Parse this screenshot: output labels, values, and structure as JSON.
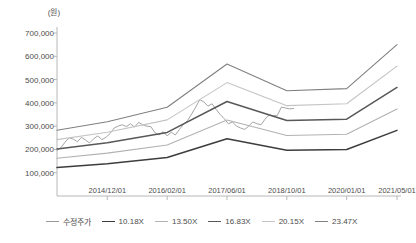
{
  "chart_data": {
    "type": "line",
    "title": "",
    "unit_label": "(원)",
    "xlabel": "",
    "ylabel": "",
    "ylim": [
      0,
      700000
    ],
    "y_ticks": [
      100000,
      200000,
      300000,
      400000,
      500000,
      600000,
      700000
    ],
    "y_tick_labels": [
      "100,000",
      "200,000",
      "300,000",
      "400,000",
      "500,000",
      "600,000",
      "700,000"
    ],
    "grid": false,
    "legend_position": "bottom",
    "x_tick_labels": [
      "2014/12/01",
      "2016/02/01",
      "2017/06/01",
      "2018/10/01",
      "2020/01/01",
      "2021/05/01"
    ],
    "x_tick_positions": [
      0.148,
      0.324,
      0.5,
      0.676,
      0.852,
      1.0
    ],
    "series": [
      {
        "name": "수정주가",
        "color": "#9a9a9a",
        "width": 0.9,
        "x": [
          0.0,
          0.012,
          0.024,
          0.036,
          0.048,
          0.06,
          0.072,
          0.084,
          0.096,
          0.108,
          0.12,
          0.132,
          0.144,
          0.156,
          0.168,
          0.18,
          0.192,
          0.204,
          0.216,
          0.228,
          0.24,
          0.252,
          0.264,
          0.276,
          0.288,
          0.3,
          0.312,
          0.324,
          0.336,
          0.348,
          0.36,
          0.372,
          0.384,
          0.396,
          0.408,
          0.42,
          0.432,
          0.444,
          0.456,
          0.468,
          0.48,
          0.492,
          0.504,
          0.516,
          0.528,
          0.54,
          0.552,
          0.564,
          0.576,
          0.588,
          0.6,
          0.612,
          0.624,
          0.636,
          0.648,
          0.66,
          0.672,
          0.684,
          0.696
        ],
        "values": [
          196000,
          208000,
          232000,
          250000,
          244000,
          233000,
          252000,
          240000,
          228000,
          246000,
          258000,
          242000,
          252000,
          268000,
          292000,
          300000,
          306000,
          298000,
          310000,
          296000,
          316000,
          306000,
          300000,
          298000,
          272000,
          262000,
          276000,
          258000,
          274000,
          262000,
          286000,
          308000,
          324000,
          352000,
          382000,
          414000,
          404000,
          386000,
          396000,
          372000,
          350000,
          332000,
          310000,
          318000,
          300000,
          292000,
          286000,
          300000,
          318000,
          310000,
          306000,
          330000,
          348000,
          344000,
          346000,
          382000,
          378000,
          374000,
          376000
        ]
      },
      {
        "name": "10.18X",
        "color": "#3d3d3d",
        "width": 1.5,
        "x": [
          0.0,
          0.148,
          0.324,
          0.5,
          0.676,
          0.852,
          1.0
        ],
        "values": [
          122000,
          139000,
          165000,
          246000,
          196000,
          200000,
          282000
        ]
      },
      {
        "name": "13.50X",
        "color": "#b2b2b2",
        "width": 1.1,
        "x": [
          0.0,
          0.148,
          0.324,
          0.5,
          0.676,
          0.852,
          1.0
        ],
        "values": [
          162000,
          184000,
          219000,
          326000,
          260000,
          265000,
          374000
        ]
      },
      {
        "name": "16.83X",
        "color": "#585858",
        "width": 1.5,
        "x": [
          0.0,
          0.148,
          0.324,
          0.5,
          0.676,
          0.852,
          1.0
        ],
        "values": [
          202000,
          229000,
          273000,
          406000,
          324000,
          330000,
          466000
        ]
      },
      {
        "name": "20.15X",
        "color": "#c4c4c4",
        "width": 1.1,
        "x": [
          0.0,
          0.148,
          0.324,
          0.5,
          0.676,
          0.852,
          1.0
        ],
        "values": [
          242000,
          274000,
          327000,
          487000,
          388000,
          396000,
          558000
        ]
      },
      {
        "name": "23.47X",
        "color": "#808080",
        "width": 1.1,
        "x": [
          0.0,
          0.148,
          0.324,
          0.5,
          0.676,
          0.852,
          1.0
        ],
        "values": [
          282000,
          319000,
          381000,
          567000,
          452000,
          461000,
          650000
        ]
      }
    ]
  },
  "axis": {
    "axis_color": "#b8b8b8"
  },
  "legend": {
    "items": [
      {
        "label": "수정주가",
        "color": "#9a9a9a",
        "width": 1.2
      },
      {
        "label": "10.18X",
        "color": "#3d3d3d",
        "width": 1.8
      },
      {
        "label": "13.50X",
        "color": "#b2b2b2",
        "width": 1.2
      },
      {
        "label": "16.83X",
        "color": "#585858",
        "width": 1.8
      },
      {
        "label": "20.15X",
        "color": "#c4c4c4",
        "width": 1.2
      },
      {
        "label": "23.47X",
        "color": "#808080",
        "width": 1.4
      }
    ]
  }
}
